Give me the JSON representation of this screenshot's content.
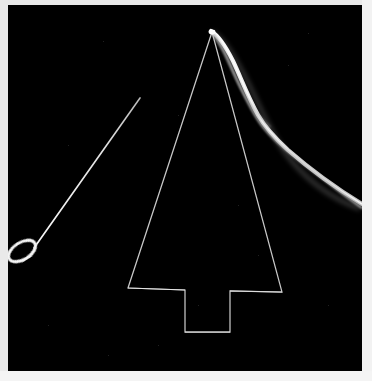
{
  "image": {
    "kind": "photograph",
    "title": "Needle and thread with wire tree outline on black background",
    "background_color": "#000000",
    "border_color": "#eeeeee",
    "line_color": "#d8d8d8",
    "thread_color": "#f0f0f0",
    "width": 372,
    "height": 381,
    "photo_area": {
      "x": 8,
      "y": 5,
      "width": 354,
      "height": 366
    }
  },
  "objects": {
    "tree_outline": {
      "label": "wire tree outline",
      "stroke": "#cfcfcf",
      "stroke_width": 1.2,
      "apex": {
        "x": 212,
        "y": 32
      },
      "left_base": {
        "x": 128,
        "y": 288
      },
      "right_base": {
        "x": 282,
        "y": 292
      },
      "trunk": {
        "left": 185,
        "right": 230,
        "bottom": 331
      },
      "points": "204,27 124,283 181,285 181,327 226,327 226,287 278,288"
    },
    "needle": {
      "label": "sewing needle",
      "stroke": "#cccccc",
      "tip": {
        "x": 140,
        "y": 98
      },
      "eye": {
        "x": 22,
        "y": 250
      },
      "loop": {
        "cx": 21,
        "cy": 250,
        "rx": 14,
        "ry": 9,
        "angle": -28
      }
    },
    "thread": {
      "label": "thread strand curving from apex to right edge",
      "stroke": "#ededed",
      "start": {
        "x": 212,
        "y": 32
      },
      "end": {
        "x": 362,
        "y": 206
      },
      "strands": 2
    }
  }
}
